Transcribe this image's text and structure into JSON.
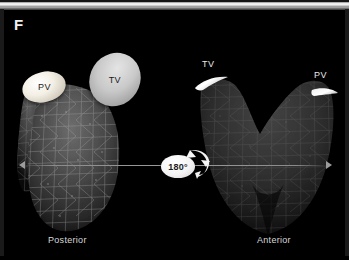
{
  "figure": {
    "panel_letter": "F",
    "background_color": "#000000"
  },
  "views": [
    {
      "id": "posterior",
      "caption": "Posterior",
      "mesh_style": "triangular wireframe, brighter",
      "valves": [
        {
          "id": "pv-left",
          "label": "PV",
          "name": "pulmonary-valve",
          "label_color": "#1a1a1a",
          "fill_color": "#f3efe4",
          "shape": "ellipse"
        },
        {
          "id": "tv-left",
          "label": "TV",
          "name": "tricuspid-valve",
          "label_color": "#1a1a1a",
          "fill_color": "#c9c9c9",
          "shape": "ellipse"
        }
      ]
    },
    {
      "id": "anterior",
      "caption": "Anterior",
      "mesh_style": "triangular wireframe, dimmer U-shaped",
      "valves": [
        {
          "id": "tv-right",
          "label": "TV",
          "name": "tricuspid-valve",
          "label_color": "#e9e9e9",
          "fill_color": "#ffffff",
          "shape": "crescent"
        },
        {
          "id": "pv-right",
          "label": "PV",
          "name": "pulmonary-valve",
          "label_color": "#e9e9e9",
          "fill_color": "#ffffff",
          "shape": "crescent"
        }
      ]
    }
  ],
  "rotation_indicator": {
    "angle_label": "180°",
    "badge_color": "#f4f4f4",
    "text_color": "#1c1c1c",
    "line_color": "#9c9c9c",
    "icon": "rotation-arrow-icon"
  },
  "colors": {
    "background": "#000000",
    "mesh_bright": "#9a9a9a",
    "mesh_dim": "#4a4a4a",
    "caption_text": "#d8d8d8",
    "panel_letter": "#f0f0f0",
    "top_strip": "#f2f2f2"
  }
}
